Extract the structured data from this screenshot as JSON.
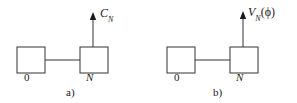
{
  "figure": {
    "background_color": "#ffffff",
    "stroke_color": "#333333",
    "text_color": "#1a1a1a",
    "panels": [
      {
        "caption": "a)",
        "nodes": [
          {
            "label": "0",
            "position": "left"
          },
          {
            "label": "N",
            "position": "right"
          }
        ],
        "output_arrow": {
          "label_base": "C",
          "label_subscript": "N",
          "label_full": "C_N",
          "direction": "up",
          "from_node": "N"
        },
        "connection": {
          "from": "0",
          "to": "N",
          "style": "solid-line"
        }
      },
      {
        "caption": "b)",
        "nodes": [
          {
            "label": "0",
            "position": "left"
          },
          {
            "label": "N",
            "position": "right"
          }
        ],
        "output_arrow": {
          "label_base": "V",
          "label_subscript": "N",
          "label_argument": "(ϕ)",
          "label_full": "V_N(ϕ)",
          "direction": "up",
          "from_node": "N"
        },
        "connection": {
          "from": "0",
          "to": "N",
          "style": "solid-line"
        }
      }
    ]
  }
}
